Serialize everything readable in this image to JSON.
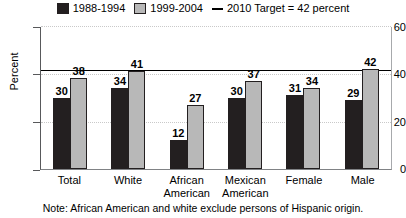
{
  "chart_data": {
    "type": "bar",
    "title": "",
    "xlabel": "",
    "ylabel": "Percent",
    "ylim": [
      0,
      60
    ],
    "yticks": [
      0,
      20,
      40,
      60
    ],
    "grid": true,
    "legend_position": "top-center",
    "categories": [
      "Total",
      "White",
      "African American",
      "Mexican American",
      "Female",
      "Male"
    ],
    "series": [
      {
        "name": "1988-1994",
        "color": "#231f20",
        "values": [
          30,
          34,
          12,
          30,
          31,
          29
        ]
      },
      {
        "name": "1999-2004",
        "color": "#b8b8b8",
        "values": [
          38,
          41,
          27,
          37,
          34,
          42
        ]
      }
    ],
    "reference_line": {
      "label": "2010 Target = 42 percent",
      "value": 42,
      "color": "#000000"
    },
    "note": "Note: African American and white exclude persons of Hispanic origin."
  },
  "legend": {
    "items": [
      {
        "label": "1988-1994",
        "swatch": "dark"
      },
      {
        "label": "1999-2004",
        "swatch": "light"
      },
      {
        "label": "2010 Target = 42 percent",
        "swatch": "dash"
      }
    ]
  }
}
